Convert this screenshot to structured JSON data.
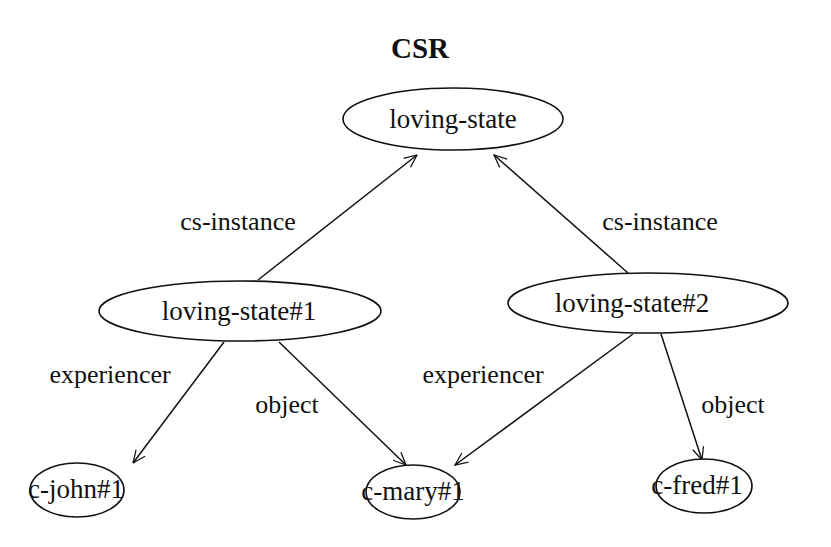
{
  "title": "CSR",
  "nodes": [
    {
      "id": "loving-state",
      "label": "loving-state"
    },
    {
      "id": "loving-state-1",
      "label": "loving-state#1"
    },
    {
      "id": "loving-state-2",
      "label": "loving-state#2"
    },
    {
      "id": "c-john-1",
      "label": "c-john#1"
    },
    {
      "id": "c-mary-1",
      "label": "c-mary#1"
    },
    {
      "id": "c-fred-1",
      "label": "c-fred#1"
    }
  ],
  "edges": [
    {
      "from": "loving-state#1",
      "to": "loving-state",
      "label": "cs-instance"
    },
    {
      "from": "loving-state#2",
      "to": "loving-state",
      "label": "cs-instance"
    },
    {
      "from": "loving-state#1",
      "to": "c-john#1",
      "label": "experiencer"
    },
    {
      "from": "loving-state#1",
      "to": "c-mary#1",
      "label": "object"
    },
    {
      "from": "loving-state#2",
      "to": "c-mary#1",
      "label": "experiencer"
    },
    {
      "from": "loving-state#2",
      "to": "c-fred#1",
      "label": "object"
    }
  ]
}
